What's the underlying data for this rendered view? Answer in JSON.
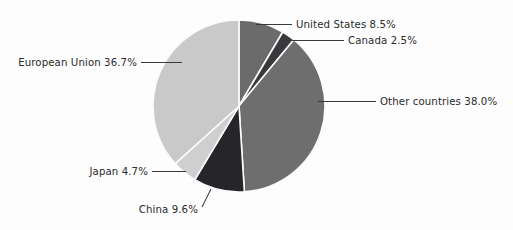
{
  "chart_data": {
    "type": "pie",
    "title": "",
    "subtitle": "",
    "xlabel": "",
    "ylabel": "",
    "legend_position": "none",
    "grid": false,
    "labels_outside": true,
    "units": "percent",
    "categories": [
      "United States",
      "Canada",
      "Other countries",
      "China",
      "Japan",
      "European Union"
    ],
    "values": [
      8.5,
      2.5,
      38.0,
      9.6,
      4.7,
      36.7
    ],
    "slice_colors": [
      "#6b6b6b",
      "#3a3a3e",
      "#6e6e6e",
      "#26262a",
      "#cfcfcf",
      "#c9c9c9"
    ],
    "start_angle_deg": 0,
    "direction": "clockwise",
    "slices": [
      {
        "name": "United States",
        "value": 8.5,
        "label": "United States 8.5%",
        "color": "#6b6b6b",
        "start_deg": 0.0,
        "end_deg": 30.6
      },
      {
        "name": "Canada",
        "value": 2.5,
        "label": "Canada 2.5%",
        "color": "#3a3a3e",
        "start_deg": 30.6,
        "end_deg": 39.6
      },
      {
        "name": "Other countries",
        "value": 38.0,
        "label": "Other countries 38.0%",
        "color": "#6e6e6e",
        "start_deg": 39.6,
        "end_deg": 176.4
      },
      {
        "name": "China",
        "value": 9.6,
        "label": "China 9.6%",
        "color": "#26262a",
        "start_deg": 176.4,
        "end_deg": 211.0
      },
      {
        "name": "Japan",
        "value": 4.7,
        "label": "Japan 4.7%",
        "color": "#cfcfcf",
        "start_deg": 211.0,
        "end_deg": 227.9
      },
      {
        "name": "European Union",
        "value": 36.7,
        "label": "European Union 36.7%",
        "color": "#c9c9c9",
        "start_deg": 227.9,
        "end_deg": 360.0
      }
    ]
  },
  "labels": {
    "united_states": "United States 8.5%",
    "canada": "Canada 2.5%",
    "other_countries": "Other countries 38.0%",
    "china": "China 9.6%",
    "japan": "Japan 4.7%",
    "european_union": "European Union 36.7%"
  },
  "colors": {
    "background": "#fdfdfd",
    "text": "#2b2b2b",
    "leader": "#3a3a3a",
    "separator": "#fbfbfb"
  }
}
